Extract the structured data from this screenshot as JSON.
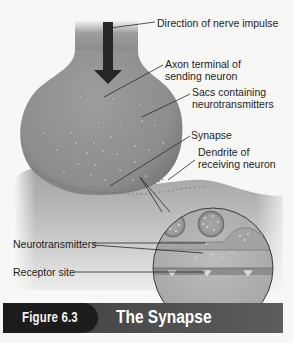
{
  "figure": {
    "number": "Figure 6.3",
    "title": "The Synapse"
  },
  "labels": {
    "direction": "Direction of nerve impulse",
    "axon_line1": "Axon terminal of",
    "axon_line2": "sending neuron",
    "sacs_line1": "Sacs containing",
    "sacs_line2": "neurotransmitters",
    "synapse": "Synapse",
    "dendrite_line1": "Dendrite of",
    "dendrite_line2": "receiving neuron",
    "neurotransmitters": "Neurotransmitters",
    "receptor": "Receptor site"
  },
  "colors": {
    "background": "#f7f7f6",
    "neuron_gray": "#8e8e8e",
    "arrow": "#262626",
    "banner_dark": "#1c1c1c",
    "banner_mid": "#4a4a4a",
    "text": "#1e1e1e"
  }
}
